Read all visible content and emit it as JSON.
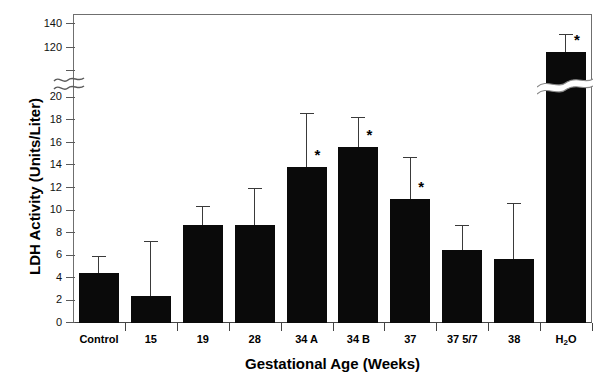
{
  "chart_data": {
    "type": "bar",
    "title": "",
    "xlabel": "Gestational Age (Weeks)",
    "ylabel": "LDH Activity (Units/Liter)",
    "categories": [
      "Control",
      "15",
      "19",
      "28",
      "34 A",
      "34 B",
      "37",
      "37 5/7",
      "38",
      "H2O"
    ],
    "category_labels_html": [
      "Control",
      "15",
      "19",
      "28",
      "34 A",
      "34 B",
      "37",
      "37 5/7",
      "38",
      "H<sub>2</sub>O"
    ],
    "values": [
      4.4,
      2.4,
      8.7,
      8.7,
      13.8,
      15.6,
      11.0,
      6.5,
      5.7,
      116.5
    ],
    "errors_upper": [
      5.9,
      7.3,
      10.4,
      12.0,
      18.6,
      18.3,
      14.7,
      8.7,
      10.6,
      132.0
    ],
    "significance_markers": [
      "",
      "",
      "",
      "",
      "*",
      "*",
      "*",
      "",
      "",
      "*"
    ],
    "significance_symbol": "*",
    "ylim": [
      0,
      150
    ],
    "y_ticks_lower": [
      0,
      2,
      4,
      6,
      8,
      10,
      12,
      14,
      16,
      18,
      20
    ],
    "y_ticks_upper": [
      120,
      140
    ],
    "axis_break": {
      "low": 20,
      "high": 120,
      "present": true
    },
    "grid": false,
    "legend": false,
    "bar_color": "#0a0a0a",
    "error_color": "#3a3a3a",
    "axis_color": "#5a5a5a"
  }
}
